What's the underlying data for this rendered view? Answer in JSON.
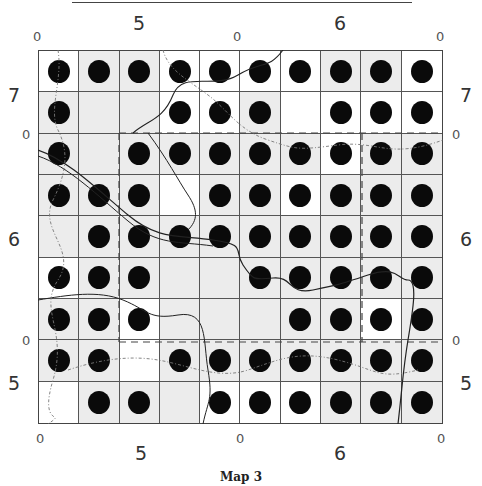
{
  "map": {
    "caption": "Map 3",
    "top_labels": {
      "major": [
        {
          "text": "5",
          "x": 133
        },
        {
          "text": "6",
          "x": 334
        }
      ],
      "minor": [
        {
          "text": "0",
          "x": 33
        },
        {
          "text": "0",
          "x": 233
        },
        {
          "text": "0",
          "x": 436
        }
      ]
    },
    "bottom_labels": {
      "major": [
        {
          "text": "5",
          "x": 135
        },
        {
          "text": "6",
          "x": 334
        }
      ],
      "minor": [
        {
          "text": "0",
          "x": 36
        },
        {
          "text": "0",
          "x": 236
        },
        {
          "text": "0",
          "x": 437
        }
      ]
    },
    "left_labels": {
      "major": [
        {
          "text": "7",
          "y": 86
        },
        {
          "text": "6",
          "y": 230
        },
        {
          "text": "5",
          "y": 374
        }
      ],
      "minor": [
        {
          "text": "0",
          "y": 128
        },
        {
          "text": "0",
          "y": 334
        }
      ]
    },
    "right_labels": {
      "major": [
        {
          "text": "7",
          "y": 86
        },
        {
          "text": "6",
          "y": 230
        },
        {
          "text": "5",
          "y": 374
        }
      ],
      "minor": [
        {
          "text": "0",
          "y": 128
        },
        {
          "text": "0",
          "y": 334
        }
      ]
    },
    "grid": {
      "columns": 10,
      "rows": 9,
      "presence": [
        [
          1,
          1,
          1,
          1,
          1,
          1,
          1,
          1,
          1,
          1
        ],
        [
          1,
          0,
          0,
          1,
          1,
          1,
          0,
          1,
          1,
          1
        ],
        [
          1,
          0,
          1,
          1,
          1,
          1,
          1,
          1,
          1,
          1
        ],
        [
          1,
          1,
          1,
          0,
          1,
          1,
          1,
          1,
          1,
          1
        ],
        [
          0,
          1,
          1,
          1,
          1,
          1,
          1,
          1,
          1,
          1
        ],
        [
          1,
          1,
          1,
          0,
          0,
          1,
          1,
          1,
          1,
          1
        ],
        [
          1,
          1,
          1,
          0,
          0,
          0,
          1,
          1,
          1,
          1
        ],
        [
          1,
          1,
          0,
          1,
          1,
          1,
          1,
          1,
          1,
          1
        ],
        [
          0,
          1,
          1,
          0,
          1,
          1,
          1,
          1,
          1,
          1
        ]
      ],
      "shaded": [
        [
          0,
          1,
          1,
          0,
          0,
          0,
          0,
          1,
          1,
          0
        ],
        [
          1,
          1,
          1,
          0,
          0,
          1,
          0,
          0,
          0,
          0
        ],
        [
          1,
          1,
          1,
          1,
          1,
          1,
          1,
          0,
          1,
          1
        ],
        [
          1,
          1,
          1,
          0,
          1,
          1,
          0,
          1,
          1,
          1
        ],
        [
          1,
          1,
          1,
          1,
          1,
          1,
          1,
          1,
          1,
          1
        ],
        [
          0,
          1,
          1,
          1,
          1,
          1,
          1,
          1,
          1,
          1
        ],
        [
          1,
          1,
          0,
          1,
          1,
          1,
          1,
          1,
          0,
          1
        ],
        [
          1,
          1,
          0,
          1,
          1,
          1,
          1,
          1,
          1,
          1
        ],
        [
          0,
          1,
          1,
          1,
          0,
          0,
          0,
          1,
          1,
          1
        ]
      ]
    },
    "colors": {
      "dot": "#0a0a0a",
      "shade": "#ececec",
      "grid_line": "#555555"
    }
  }
}
